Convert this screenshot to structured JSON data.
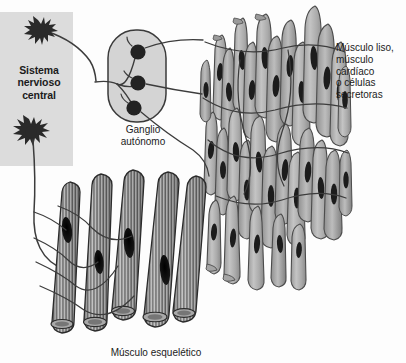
{
  "figure": {
    "background_color": "#fdfdfd",
    "width": 406,
    "height": 363
  },
  "cns": {
    "label": "Sistema\nnervioso\ncentral",
    "box_color": "#dcdcdc",
    "neuron_color": "#2a2a2a",
    "neuron_count": 2,
    "neurons": [
      {
        "name": "preganglionic-autonomic-neuron",
        "cx": 41,
        "cy": 33
      },
      {
        "name": "somatic-motor-neuron",
        "cx": 31,
        "cy": 133
      }
    ]
  },
  "ganglion": {
    "label": "Ganglio\nautónomo",
    "fill_color": "#d4d4d4",
    "outline_color": "#3a3a3a",
    "cell_body_color": "#232323",
    "cell_body_count": 3,
    "cell_bodies": [
      {
        "name": "postganglionic-neuron-1",
        "cx": 138,
        "cy": 52
      },
      {
        "name": "postganglionic-neuron-2",
        "cx": 138,
        "cy": 83
      },
      {
        "name": "postganglionic-neuron-3",
        "cx": 134,
        "cy": 108
      }
    ]
  },
  "smooth_muscle": {
    "label": "Músculo liso,\nmúsculo\ncardíaco\no células\nsecretoras",
    "cell_fill_light": "#b9b9b9",
    "cell_fill_dark": "#8e8e8e",
    "cell_outline": "#4a4a4a",
    "nucleus_color": "#1c1c1c",
    "cell_count": 34,
    "nerve_fiber_count": 6
  },
  "skeletal_muscle": {
    "label": "Músculo esquelético",
    "fiber_count": 5,
    "fiber_fill": "#b4b4b4",
    "striation_color": "#2b2b2b",
    "endplate_color": "#141414",
    "endplate_count": 4,
    "nerve_fiber_count": 5
  },
  "nerve_fibers": {
    "color": "#3c3c3c",
    "autonomic_preganglionic_count": 1,
    "autonomic_postganglionic_count": 3,
    "somatic_count": 1
  }
}
